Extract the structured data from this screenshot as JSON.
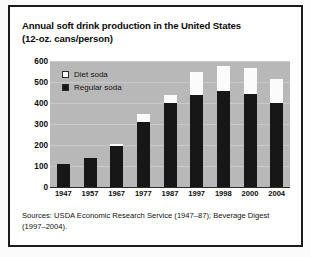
{
  "title": {
    "line1": "Annual soft drink production in the United States",
    "line2": "(12-oz. cans/person)"
  },
  "source": {
    "line1": "Sources: USDA Economic Research Service (1947–87); Beverage Digest",
    "line2": "(1997–2004)."
  },
  "legend": {
    "items": [
      {
        "label": "Diet soda",
        "color": "#fbfbfb"
      },
      {
        "label": "Regular soda",
        "color": "#171717"
      }
    ]
  },
  "colors": {
    "plot_background": "#b8b8b8",
    "regular_soda": "#171717",
    "diet_soda": "#fbfbfb",
    "frame": "#1b1b1b",
    "text": "#0c0c0c"
  },
  "chart_data": {
    "type": "bar",
    "subtype": "stacked",
    "title": "Annual soft drink production in the United States (12-oz. cans/person)",
    "xlabel": "",
    "ylabel": "",
    "ylim": [
      0,
      600
    ],
    "yticks": [
      0,
      100,
      200,
      300,
      400,
      500,
      600
    ],
    "grid": true,
    "legend_position": "inside-top-left",
    "categories": [
      "1947",
      "1957",
      "1967",
      "1977",
      "1987",
      "1997",
      "1998",
      "2000",
      "2004"
    ],
    "series": [
      {
        "name": "Regular soda",
        "color": "#171717",
        "values": [
          110,
          140,
          195,
          310,
          400,
          440,
          455,
          445,
          400
        ]
      },
      {
        "name": "Diet soda",
        "color": "#fbfbfb",
        "values": [
          0,
          0,
          10,
          40,
          40,
          110,
          120,
          120,
          115
        ]
      }
    ],
    "totals": [
      110,
      140,
      205,
      350,
      440,
      550,
      575,
      565,
      515
    ]
  }
}
